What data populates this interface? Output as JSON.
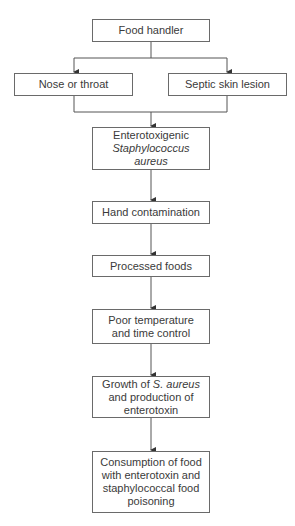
{
  "diagram": {
    "type": "flowchart",
    "nodes": {
      "food_handler": "Food handler",
      "nose_throat": "Nose or throat",
      "skin_lesion": "Septic skin lesion",
      "entero_l1": "Enterotoxigenic",
      "entero_l2": "Staphylococcus",
      "entero_l3": "aureus",
      "hand": "Hand contamination",
      "processed": "Processed foods",
      "poor_l1": "Poor temperature",
      "poor_l2": "and time control",
      "growth_l1a": "Growth of ",
      "growth_l1b": "S. aureus",
      "growth_l2": "and production of",
      "growth_l3": "enterotoxin",
      "cons_l1": "Consumption of food",
      "cons_l2": "with enterotoxin and",
      "cons_l3": "staphylococcal food",
      "cons_l4": "poisoning"
    },
    "edges": [
      [
        "Food handler",
        "Nose or throat"
      ],
      [
        "Food handler",
        "Septic skin lesion"
      ],
      [
        "Nose or throat",
        "Enterotoxigenic Staphylococcus aureus"
      ],
      [
        "Septic skin lesion",
        "Enterotoxigenic Staphylococcus aureus"
      ],
      [
        "Enterotoxigenic Staphylococcus aureus",
        "Hand contamination"
      ],
      [
        "Hand contamination",
        "Processed foods"
      ],
      [
        "Processed foods",
        "Poor temperature and time control"
      ],
      [
        "Poor temperature and time control",
        "Growth of S. aureus and production of enterotoxin"
      ],
      [
        "Growth of S. aureus and production of enterotoxin",
        "Consumption of food with enterotoxin and staphylococcal food poisoning"
      ]
    ],
    "colors": {
      "line": "#555555",
      "border": "#6a6a6a",
      "text": "#3a3a3a"
    }
  }
}
